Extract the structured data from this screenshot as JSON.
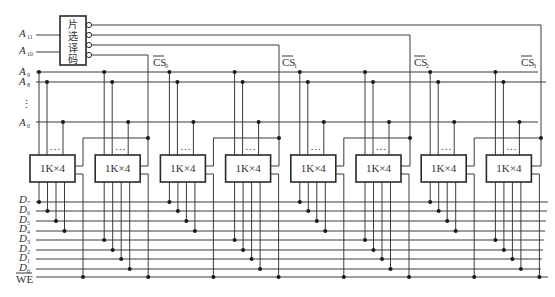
{
  "diagram": {
    "decoder": {
      "label_chars": [
        "片",
        "选",
        "译",
        "码"
      ],
      "inputs": [
        {
          "name": "A",
          "sub": "11"
        },
        {
          "name": "A",
          "sub": "10"
        }
      ]
    },
    "address_lines": [
      {
        "name": "A",
        "sub": "9"
      },
      {
        "name": "A",
        "sub": "8"
      },
      {
        "name": "A",
        "sub": "0"
      }
    ],
    "address_ellipsis": "⋮",
    "chip_select_labels": [
      {
        "name": "CS",
        "sub": "0"
      },
      {
        "name": "CS",
        "sub": "1"
      },
      {
        "name": "CS",
        "sub": "2"
      },
      {
        "name": "CS",
        "sub": "3"
      }
    ],
    "chips": [
      {
        "label": "1K×4",
        "ellipsis": "…"
      },
      {
        "label": "1K×4",
        "ellipsis": "…"
      },
      {
        "label": "1K×4",
        "ellipsis": "…"
      },
      {
        "label": "1K×4",
        "ellipsis": "…"
      },
      {
        "label": "1K×4",
        "ellipsis": "…"
      },
      {
        "label": "1K×4",
        "ellipsis": "…"
      },
      {
        "label": "1K×4",
        "ellipsis": "…"
      },
      {
        "label": "1K×4",
        "ellipsis": "…"
      }
    ],
    "data_lines": [
      {
        "name": "D",
        "sub": "7"
      },
      {
        "name": "D",
        "sub": "6"
      },
      {
        "name": "D",
        "sub": "5"
      },
      {
        "name": "D",
        "sub": "4"
      },
      {
        "name": "D",
        "sub": "3"
      },
      {
        "name": "D",
        "sub": "2"
      },
      {
        "name": "D",
        "sub": "1"
      },
      {
        "name": "D",
        "sub": "0"
      }
    ],
    "we_label": "WE"
  }
}
